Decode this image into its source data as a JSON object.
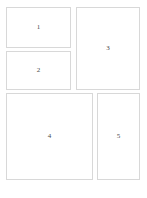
{
  "canvas": {
    "width": 147,
    "height": 198,
    "background_color": "#ffffff",
    "border_color": "#d8d8d8",
    "label_color": "#4a4a4a"
  },
  "layout": {
    "kind": "wireframe-grid",
    "panel_count": 5,
    "panels": [
      {
        "id": "panel-1",
        "label": "1",
        "x": 6,
        "y": 7,
        "width": 65,
        "height": 41,
        "column": "left",
        "row": 1
      },
      {
        "id": "panel-2",
        "label": "2",
        "x": 6,
        "y": 51,
        "width": 65,
        "height": 39,
        "column": "left",
        "row": 2
      },
      {
        "id": "panel-3",
        "label": "3",
        "x": 76,
        "y": 7,
        "width": 64,
        "height": 83,
        "column": "right",
        "row": 1
      },
      {
        "id": "panel-4",
        "label": "4",
        "x": 6,
        "y": 93,
        "width": 87,
        "height": 87,
        "column": "left",
        "row": 3
      },
      {
        "id": "panel-5",
        "label": "5",
        "x": 97,
        "y": 93,
        "width": 43,
        "height": 87,
        "column": "right",
        "row": 3
      }
    ]
  }
}
